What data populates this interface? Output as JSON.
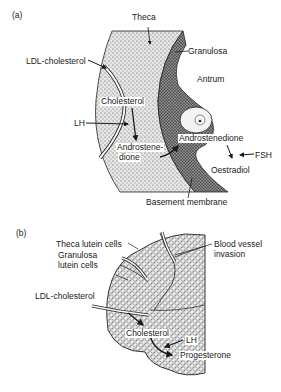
{
  "panels": [
    {
      "tag": "(a)",
      "labels": {
        "theca": "Theca",
        "granulosa": "Granulosa",
        "ldl": "LDL-cholesterol",
        "antrum": "Antrum",
        "cholesterol": "Cholesterol",
        "lh": "LH",
        "androstenedione_theca_1": "Androstene-",
        "androstenedione_theca_2": "dione",
        "androstenedione_gran": "Androstenedione",
        "fsh": "FSH",
        "oestradiol": "Oestradiol",
        "basement": "Basement membrane"
      }
    },
    {
      "tag": "(b)",
      "labels": {
        "theca_lutein": "Theca lutein cells",
        "granulosa_lutein_1": "Granulosa",
        "granulosa_lutein_2": "lutein cells",
        "blood_vessel_1": "Blood vessel",
        "blood_vessel_2": "invasion",
        "ldl": "LDL-cholesterol",
        "cholesterol": "Cholesterol",
        "lh": "LH",
        "progesterone": "Progesterone"
      }
    }
  ],
  "colors": {
    "ink": "#1a1a1a",
    "theca_fill": "#d9d9d9",
    "granulosa_fill": "#6e6e6e",
    "luteal_fill": "#cfcfcf",
    "background": "#ffffff"
  }
}
